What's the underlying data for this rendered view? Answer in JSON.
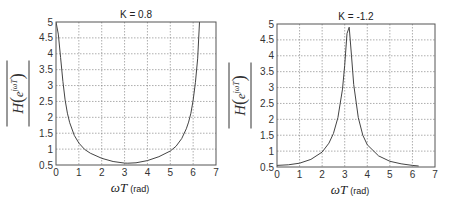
{
  "chart_data": [
    {
      "type": "line",
      "title": "K = 0.8",
      "xlabel": "ωT (rad)",
      "ylabel": "|H(e^{jωT})|",
      "xlim": [
        0,
        7
      ],
      "ylim": [
        0.5,
        5
      ],
      "xticks": [
        0,
        1,
        2,
        3,
        4,
        5,
        6,
        7
      ],
      "yticks": [
        0.5,
        1,
        1.5,
        2,
        2.5,
        3,
        3.5,
        4,
        4.5,
        5
      ],
      "grid": true,
      "x": [
        0,
        0.1,
        0.2,
        0.3,
        0.4,
        0.5,
        0.6,
        0.8,
        1.0,
        1.25,
        1.5,
        2.0,
        2.5,
        3.0,
        3.14,
        3.5,
        4.0,
        4.5,
        5.0,
        5.25,
        5.5,
        5.7,
        5.8,
        5.9,
        6.0,
        6.1,
        6.2,
        6.28
      ],
      "values": [
        5.0,
        4.62,
        3.88,
        3.13,
        2.55,
        2.13,
        1.83,
        1.43,
        1.19,
        0.99,
        0.87,
        0.71,
        0.61,
        0.56,
        0.556,
        0.57,
        0.64,
        0.76,
        0.94,
        1.09,
        1.33,
        1.64,
        1.85,
        2.13,
        2.53,
        3.09,
        3.86,
        5.0
      ]
    },
    {
      "type": "line",
      "title": "K = -1.2",
      "xlabel": "ωT (rad)",
      "ylabel": "|H(e^{jωT})|",
      "xlim": [
        0,
        7
      ],
      "ylim": [
        0.5,
        5
      ],
      "xticks": [
        0,
        1,
        2,
        3,
        4,
        5,
        6,
        7
      ],
      "yticks": [
        0.5,
        1,
        1.5,
        2,
        2.5,
        3,
        3.5,
        4,
        4.5,
        5
      ],
      "grid": true,
      "x": [
        0,
        0.5,
        1.0,
        1.5,
        2.0,
        2.3,
        2.5,
        2.7,
        2.9,
        3.0,
        3.1,
        3.2,
        3.3,
        3.4,
        3.6,
        3.8,
        4.0,
        4.5,
        5.0,
        5.5,
        6.0,
        6.28
      ],
      "values": [
        0.55,
        0.57,
        0.62,
        0.74,
        0.97,
        1.25,
        1.55,
        2.05,
        2.95,
        3.7,
        4.7,
        4.9,
        4.0,
        3.1,
        2.05,
        1.5,
        1.2,
        0.85,
        0.68,
        0.6,
        0.55,
        0.53
      ]
    }
  ]
}
